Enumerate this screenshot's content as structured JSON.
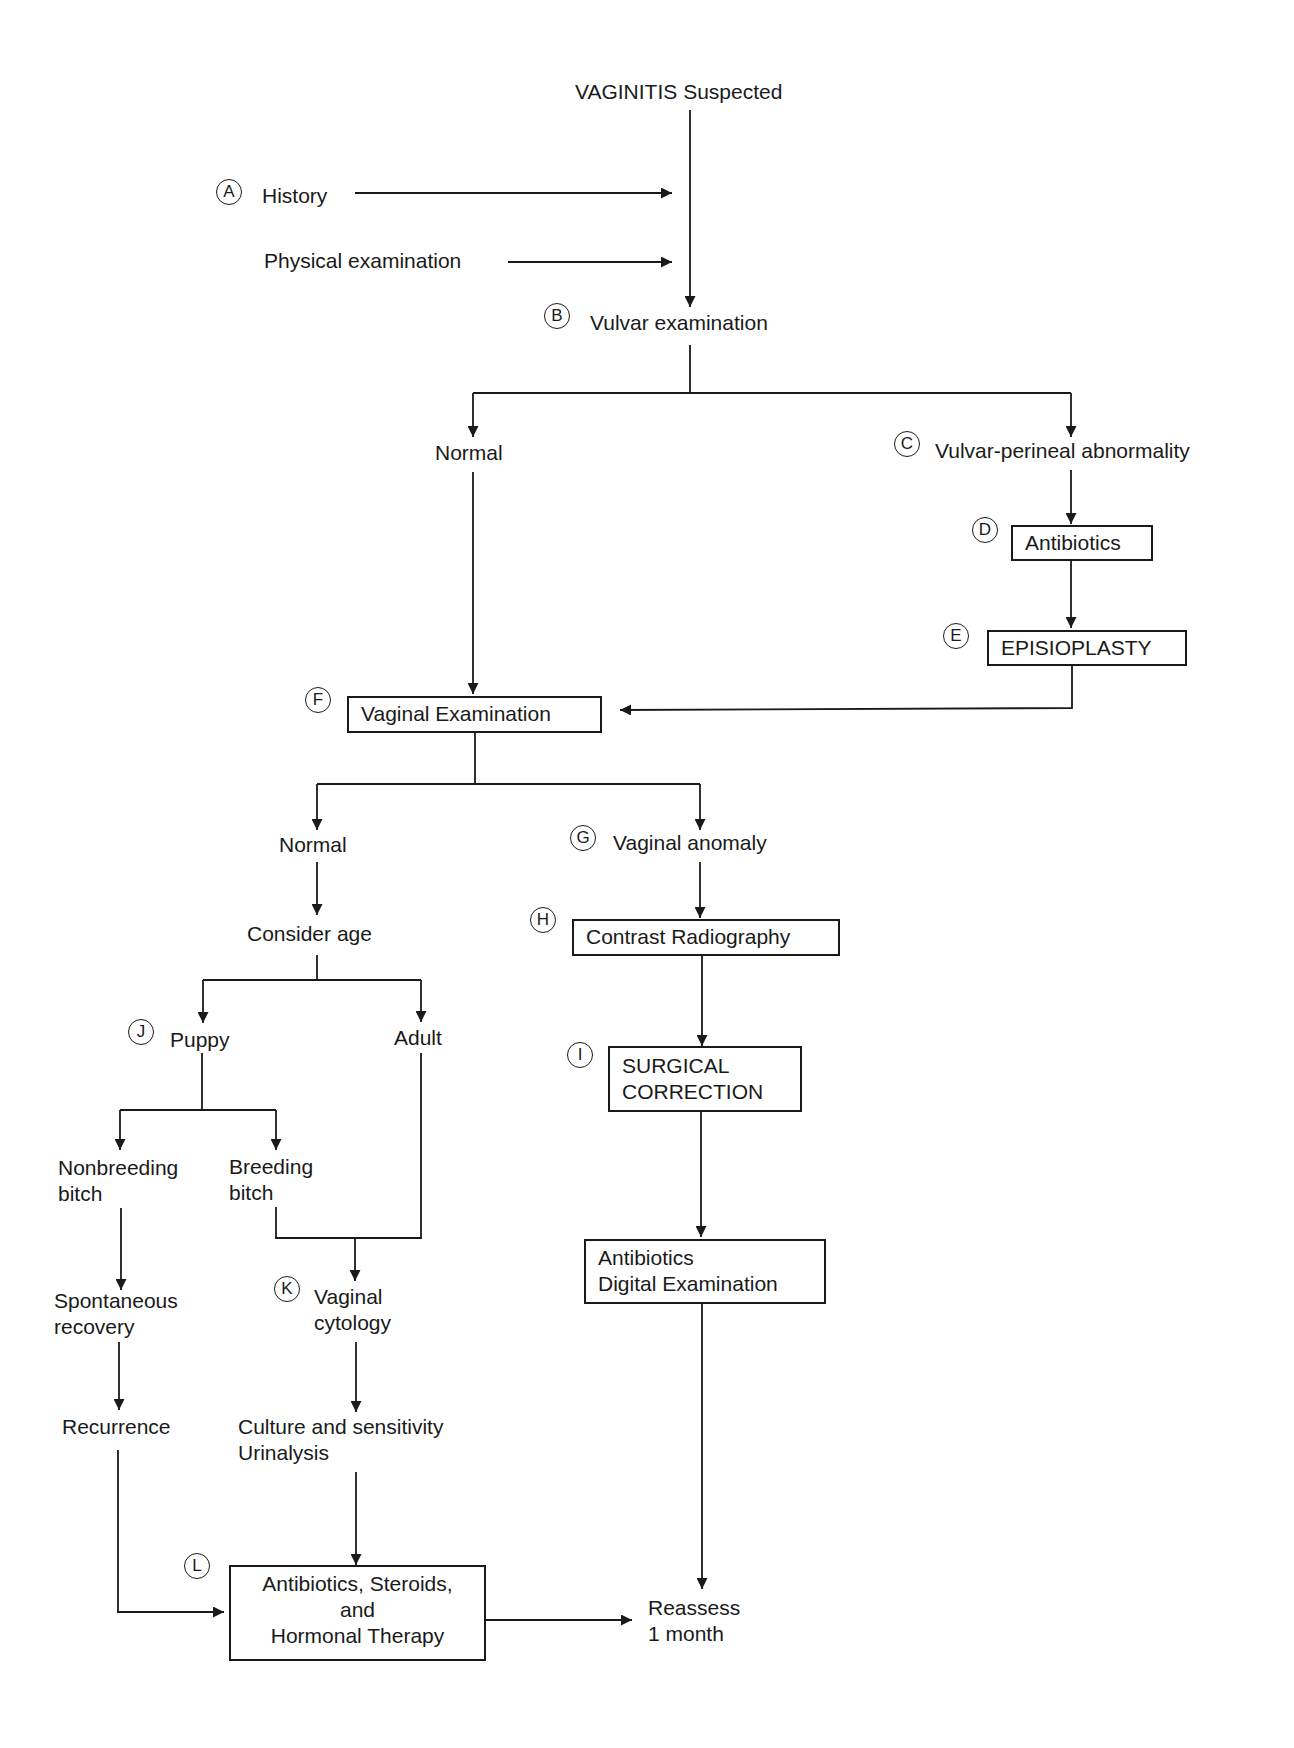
{
  "diagram": {
    "title": "VAGINITIS Suspected",
    "nodes": {
      "history": {
        "marker": "A",
        "label": "History"
      },
      "physical": {
        "label": "Physical examination"
      },
      "vulvar_exam": {
        "marker": "B",
        "label": "Vulvar examination"
      },
      "vulvar_normal": {
        "label": "Normal"
      },
      "vulvar_abnormal": {
        "marker": "C",
        "label": "Vulvar-perineal abnormality"
      },
      "antibiotics_d": {
        "marker": "D",
        "label": "Antibiotics"
      },
      "episioplasty": {
        "marker": "E",
        "label": "EPISIOPLASTY"
      },
      "vaginal_exam": {
        "marker": "F",
        "label": "Vaginal Examination"
      },
      "vaginal_normal": {
        "label": "Normal"
      },
      "vaginal_anomaly": {
        "marker": "G",
        "label": "Vaginal anomaly"
      },
      "contrast": {
        "marker": "H",
        "label": "Contrast Radiography"
      },
      "surgical": {
        "marker": "I",
        "lines": [
          "SURGICAL",
          "CORRECTION"
        ]
      },
      "antibiotics_digital": {
        "lines": [
          "Antibiotics",
          "Digital Examination"
        ]
      },
      "consider_age": {
        "label": "Consider age"
      },
      "puppy": {
        "marker": "J",
        "label": "Puppy"
      },
      "adult": {
        "label": "Adult"
      },
      "nonbreeding": {
        "lines": [
          "Nonbreeding",
          "bitch"
        ]
      },
      "breeding": {
        "lines": [
          "Breeding",
          "bitch"
        ]
      },
      "spontaneous": {
        "lines": [
          "Spontaneous",
          "recovery"
        ]
      },
      "recurrence": {
        "label": "Recurrence"
      },
      "cytology": {
        "marker": "K",
        "lines": [
          "Vaginal",
          "cytology"
        ]
      },
      "culture": {
        "lines": [
          "Culture and sensitivity",
          "Urinalysis"
        ]
      },
      "therapy": {
        "marker": "L",
        "lines": [
          "Antibiotics, Steroids,",
          "and",
          "Hormonal Therapy"
        ]
      },
      "reassess": {
        "lines": [
          "Reassess",
          "1 month"
        ]
      }
    }
  }
}
